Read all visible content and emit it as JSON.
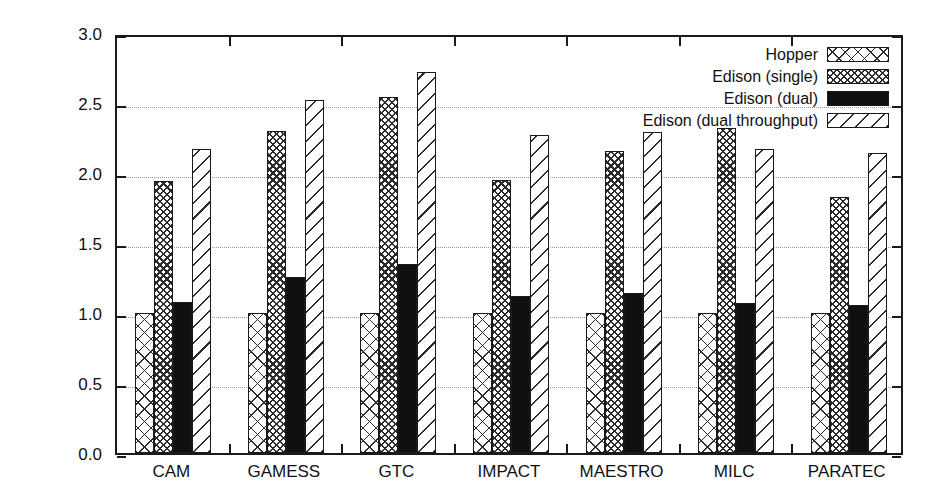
{
  "chart_data": {
    "type": "bar",
    "title": "",
    "xlabel": "",
    "ylabel": "Performance vs. Hopper",
    "ylim": [
      0.0,
      3.0
    ],
    "ytick_labels": [
      "0.0",
      "0.5",
      "1.0",
      "1.5",
      "2.0",
      "2.5",
      "3.0"
    ],
    "ytick_values": [
      0.0,
      0.5,
      1.0,
      1.5,
      2.0,
      2.5,
      3.0
    ],
    "grid": "horizontal-dotted",
    "legend_position": "top-right",
    "categories": [
      "CAM",
      "GAMESS",
      "GTC",
      "IMPACT",
      "MAESTRO",
      "MILC",
      "PARATEC"
    ],
    "series": [
      {
        "name": "Hopper",
        "pattern": "coarse-cross-hatch",
        "values": [
          1.0,
          1.0,
          1.0,
          1.0,
          1.0,
          1.0,
          1.0
        ]
      },
      {
        "name": "Edison (single)",
        "pattern": "dense-cross-hatch",
        "values": [
          1.94,
          2.3,
          2.54,
          1.95,
          2.16,
          2.32,
          1.83
        ]
      },
      {
        "name": "Edison (dual)",
        "pattern": "solid-black",
        "values": [
          1.08,
          1.26,
          1.35,
          1.12,
          1.14,
          1.07,
          1.06
        ]
      },
      {
        "name": "Edison (dual throughput)",
        "pattern": "diagonal-stripes",
        "values": [
          2.17,
          2.52,
          2.72,
          2.27,
          2.29,
          2.17,
          2.14
        ]
      }
    ]
  },
  "legend": {
    "items": [
      {
        "label": "Hopper"
      },
      {
        "label": "Edison (single)"
      },
      {
        "label": "Edison (dual)"
      },
      {
        "label": "Edison (dual throughput)"
      }
    ]
  },
  "colors": {
    "axis": "#1a1a1a",
    "grid": "#9a9a9a",
    "ink": "#2b2b2b",
    "fill_solid": "#101010",
    "background": "#ffffff"
  }
}
